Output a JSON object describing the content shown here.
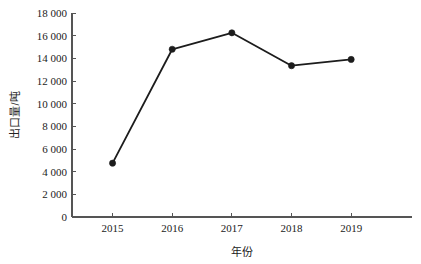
{
  "chart_data": {
    "type": "line",
    "title": "",
    "xlabel": "年份",
    "ylabel": "出口量/吨",
    "categories": [
      "2015",
      "2016",
      "2017",
      "2018",
      "2019"
    ],
    "values": [
      4750,
      14800,
      16250,
      13350,
      13900
    ],
    "series": [
      {
        "name": "出口量",
        "values": [
          4750,
          14800,
          16250,
          13350,
          13900
        ]
      }
    ],
    "ylim": [
      0,
      18000
    ],
    "ytick_values": [
      0,
      2000,
      4000,
      6000,
      8000,
      10000,
      12000,
      14000,
      16000,
      18000
    ],
    "ytick_labels": [
      "0",
      "2 000",
      "4 000",
      "6 000",
      "8 000",
      "10 000",
      "12 000",
      "14 000",
      "16 000",
      "18 000"
    ],
    "xtick_labels": [
      "2015",
      "2016",
      "2017",
      "2018",
      "2019"
    ],
    "grid": false,
    "legend": "none",
    "line_color": "#1c1c1c",
    "marker_color": "#1c1c1c",
    "axis_color": "#555555",
    "background_color": "#ffffff"
  },
  "axis_titles": {
    "x": "年份",
    "y": "出口量/吨"
  }
}
